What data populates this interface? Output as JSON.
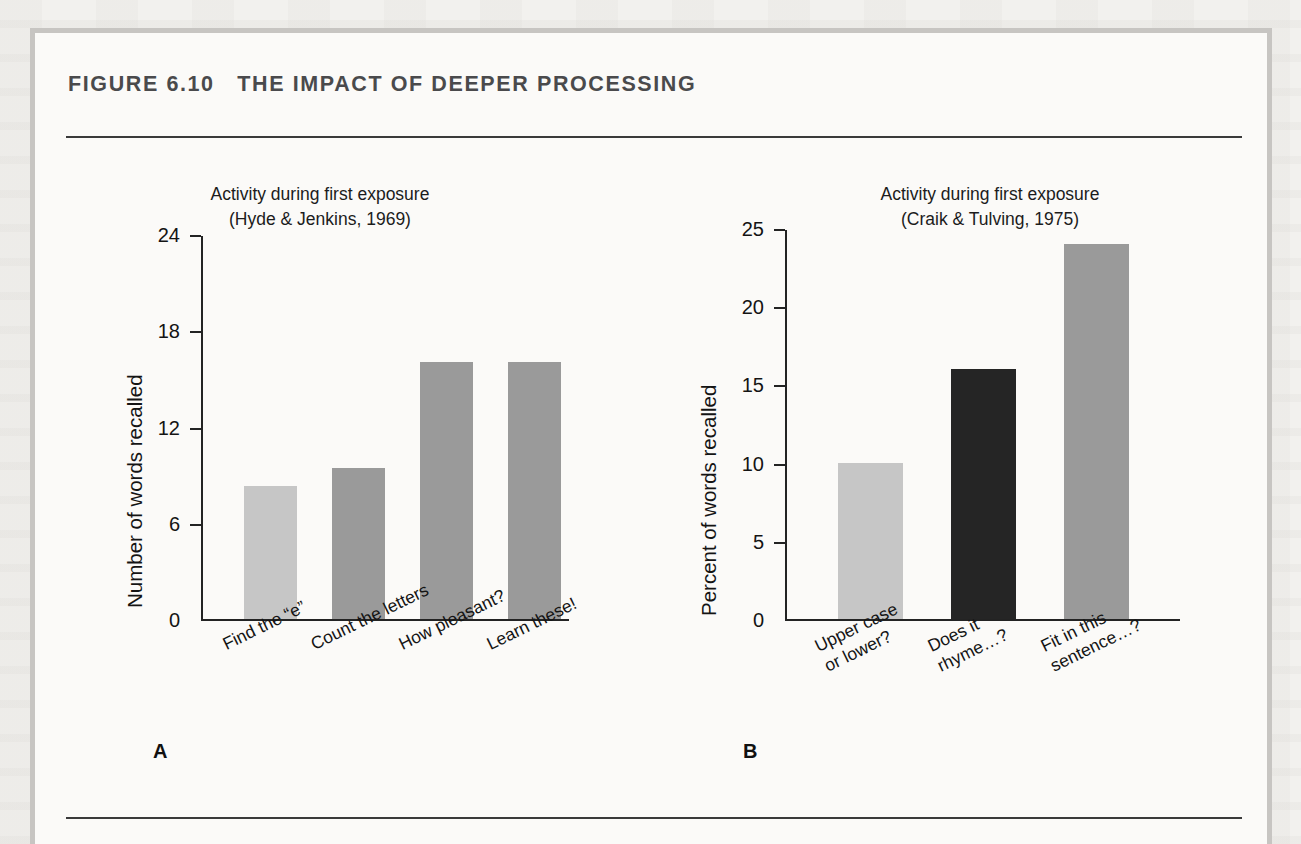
{
  "figure": {
    "label": "FIGURE 6.10",
    "title": "THE IMPACT OF DEEPER PROCESSING",
    "heading": "FIGURE 6.10   THE IMPACT OF DEEPER PROCESSING",
    "panel_a_letter": "A",
    "panel_b_letter": "B"
  },
  "colors": {
    "page_background": "#f2f1ee",
    "figure_background": "#fbfaf8",
    "frame_border": "#c7c5c2",
    "rule": "#3a3a3a",
    "title_text": "#4a4a4c",
    "body_text": "#141414",
    "bar_light": "#c6c6c6",
    "bar_medium": "#9a9a9a",
    "bar_dark": "#252525"
  },
  "chart_data": [
    {
      "type": "bar",
      "panel": "A",
      "title": "Activity during first exposure",
      "subtitle": "(Hyde & Jenkins, 1969)",
      "title_lines": [
        "Activity during first exposure",
        "(Hyde & Jenkins, 1969)"
      ],
      "xlabel": "",
      "ylabel": "Number of words recalled",
      "ylim": [
        0,
        24
      ],
      "yticks": [
        0,
        6,
        12,
        18,
        24
      ],
      "ytick_labels": [
        "0",
        "6",
        "12",
        "18",
        "24"
      ],
      "grid": false,
      "legend": "none",
      "categories": [
        "Find the “e”",
        "Count the letters",
        "How pleasant?",
        "Learn these!"
      ],
      "values": [
        8.3,
        9.4,
        16,
        16
      ],
      "bar_colors": [
        "#c6c6c6",
        "#9a9a9a",
        "#9a9a9a",
        "#9a9a9a"
      ]
    },
    {
      "type": "bar",
      "panel": "B",
      "title": "Activity during first exposure",
      "subtitle": "(Craik & Tulving, 1975)",
      "title_lines": [
        "Activity during first exposure",
        "(Craik & Tulving, 1975)"
      ],
      "xlabel": "",
      "ylabel": "Percent of words recalled",
      "ylim": [
        0,
        25
      ],
      "yticks": [
        0,
        5,
        10,
        15,
        20,
        25
      ],
      "ytick_labels": [
        "0",
        "5",
        "10",
        "15",
        "20",
        "25"
      ],
      "grid": false,
      "legend": "none",
      "categories": [
        "Upper case or lower?",
        "Does it rhyme...?",
        "Fit in this sentence...?"
      ],
      "category_lines": [
        [
          "Upper case",
          "or lower?"
        ],
        [
          "Does it",
          "rhyme…?"
        ],
        [
          "Fit in this",
          "sentence…?"
        ]
      ],
      "values": [
        10,
        16,
        24
      ],
      "bar_colors": [
        "#c6c6c6",
        "#252525",
        "#9a9a9a"
      ]
    }
  ]
}
